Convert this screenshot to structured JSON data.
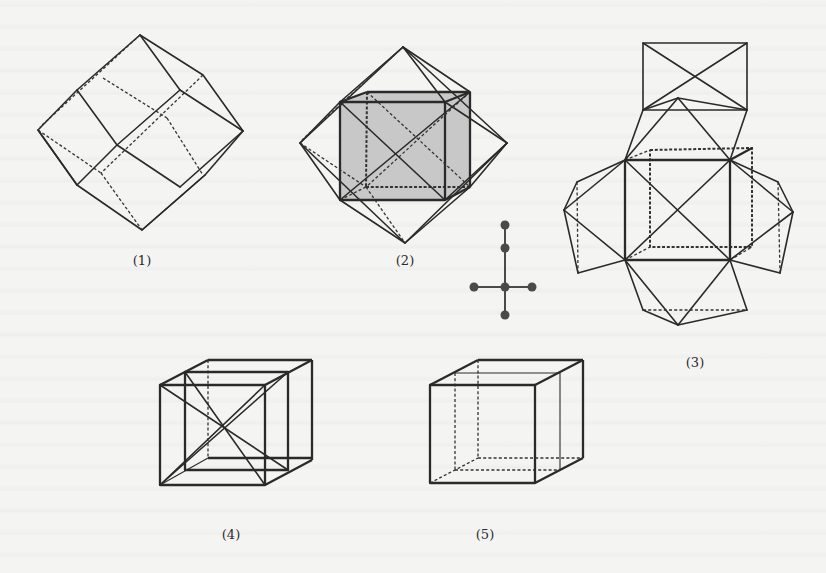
{
  "document": {
    "type": "scanned textbook figure plate",
    "background_color": "#f4f4f2",
    "ink_color": "#2a2a2a",
    "shade_color": "#c8c8c8"
  },
  "figures": [
    {
      "id": "1",
      "label": "(1)",
      "description": "rhombic dodecahedron, wireframe with hidden edges dashed"
    },
    {
      "id": "2",
      "label": "(2)",
      "description": "octahedron-like solid enclosing a shaded cube, with diagonals"
    },
    {
      "id": "3",
      "label": "(3)",
      "description": "cube with square pyramids attached to each face (stellated net view)"
    },
    {
      "id": "4",
      "label": "(4)",
      "description": "nested cubes with space diagonals"
    },
    {
      "id": "5",
      "label": "(5)",
      "description": "nested cubes wireframe with hidden edges dashed"
    }
  ],
  "graph_icon": {
    "description": "cross-shaped tree graph with 6 nodes",
    "nodes": [
      [
        0,
        -3
      ],
      [
        0,
        -2
      ],
      [
        -1,
        0
      ],
      [
        0,
        0
      ],
      [
        1,
        0
      ],
      [
        0,
        1
      ]
    ],
    "node_color": "#4a4a4a"
  }
}
